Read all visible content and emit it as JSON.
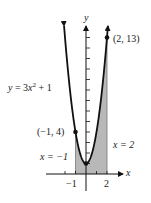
{
  "chart_data": {
    "type": "line",
    "title": "",
    "equation_label": "y = 3x² + 1",
    "function": {
      "a": 3,
      "b": 0,
      "c": 1
    },
    "xlabel": "x",
    "ylabel": "y",
    "xlim": [
      -2.1,
      3.5
    ],
    "ylim": [
      -1.6,
      14.1
    ],
    "x_ticks": [
      -2,
      -1,
      1,
      2
    ],
    "x_tick_labels": [
      {
        "value": -1,
        "label": "−1"
      },
      {
        "value": 2,
        "label": "2"
      }
    ],
    "y_ticks": [
      1,
      2,
      3,
      4,
      5,
      6,
      7,
      8,
      9,
      10,
      11,
      12,
      13
    ],
    "shaded_region": {
      "from_x": -1,
      "to_x": 2,
      "color": "#b8b8b8",
      "label_left": "x = −1",
      "label_right": "x = 2"
    },
    "points": [
      {
        "x": -1,
        "y": 4,
        "label": "(−1, 4)"
      },
      {
        "x": 2,
        "y": 13,
        "label": "(2, 13)"
      },
      {
        "x": 0,
        "y": 1,
        "label": ""
      }
    ],
    "series": [
      {
        "name": "y = 3x² + 1",
        "x": [
          -2,
          -1.5,
          -1,
          -0.5,
          0,
          0.5,
          1,
          1.5,
          2
        ],
        "values": [
          13,
          7.75,
          4,
          1.75,
          1,
          1.75,
          4,
          7.75,
          13
        ]
      }
    ],
    "grid": false,
    "legend": "none"
  },
  "colors": {
    "curve": "#111111",
    "axes": "#111111",
    "shade": "#b8b8b8"
  }
}
